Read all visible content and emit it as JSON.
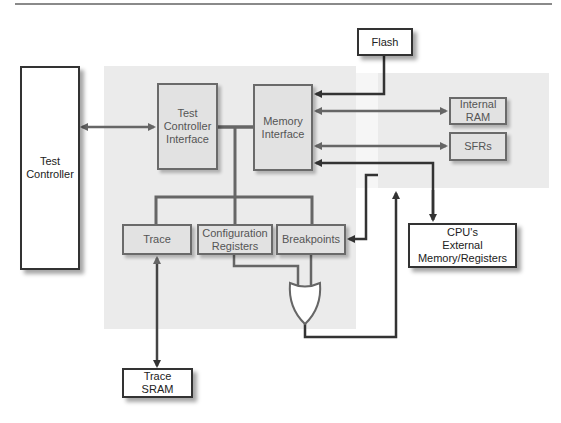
{
  "diagram": {
    "title": "",
    "blocks": {
      "test_controller": "Test\nController",
      "test_controller_interface": "Test\nController\nInterface",
      "memory_interface": "Memory\nInterface",
      "flash": "Flash",
      "internal_ram": "Internal\nRAM",
      "sfrs": "SFRs",
      "trace": "Trace",
      "configuration_registers": "Configuration\nRegisters",
      "breakpoints": "Breakpoints",
      "cpu_external": "CPU's\nExternal\nMemory/Registers",
      "trace_sram": "Trace\nSRAM"
    },
    "gates": [
      {
        "type": "OR",
        "inputs": [
          "Configuration Registers",
          "Breakpoints"
        ],
        "output": "CPU's External Memory/Registers path"
      }
    ],
    "colors": {
      "wire_dark": "#333333",
      "wire_grey": "#6a6a6a",
      "region": "#ebebeb"
    }
  }
}
